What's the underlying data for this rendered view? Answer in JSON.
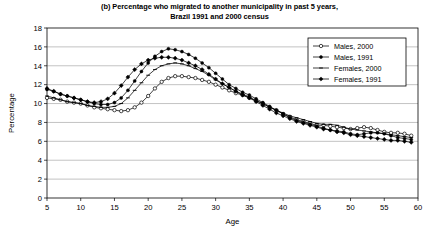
{
  "chart_data": {
    "type": "line",
    "title": "(b) Percentage who migrated to another municipality in past 5 years, Brazil 1991 and 2000 census",
    "title_line1": "(b) Percentage who migrated to another municipality in past 5 years,",
    "title_line2": "Brazil 1991 and 2000 census",
    "xlabel": "Age",
    "ylabel": "Percentage",
    "xlim": [
      5,
      60
    ],
    "ylim": [
      0,
      18
    ],
    "xticks": [
      5,
      10,
      15,
      20,
      25,
      30,
      35,
      40,
      45,
      50,
      55,
      60
    ],
    "yticks": [
      0,
      2,
      4,
      6,
      8,
      10,
      12,
      14,
      16,
      18
    ],
    "grid": "horizontal",
    "legend_position": "top-right",
    "x": [
      5,
      6,
      7,
      8,
      9,
      10,
      11,
      12,
      13,
      14,
      15,
      16,
      17,
      18,
      19,
      20,
      21,
      22,
      23,
      24,
      25,
      26,
      27,
      28,
      29,
      30,
      31,
      32,
      33,
      34,
      35,
      36,
      37,
      38,
      39,
      40,
      41,
      42,
      43,
      44,
      45,
      46,
      47,
      48,
      49,
      50,
      51,
      52,
      53,
      54,
      55,
      56,
      57,
      58,
      59
    ],
    "series": [
      {
        "name": "Males, 2000",
        "marker": "open-circle",
        "color": "#000000",
        "values": [
          10.6,
          10.5,
          10.4,
          10.2,
          10.1,
          10.0,
          9.8,
          9.6,
          9.5,
          9.4,
          9.3,
          9.2,
          9.3,
          9.6,
          10.1,
          10.8,
          11.6,
          12.3,
          12.7,
          12.9,
          12.9,
          12.8,
          12.7,
          12.5,
          12.3,
          12.0,
          11.7,
          11.4,
          11.1,
          10.9,
          10.6,
          10.3,
          10.0,
          9.6,
          9.3,
          8.9,
          8.6,
          8.3,
          8.1,
          7.9,
          7.7,
          7.7,
          7.6,
          7.5,
          7.4,
          7.3,
          7.4,
          7.5,
          7.4,
          7.2,
          7.0,
          6.9,
          6.9,
          6.8,
          6.6
        ]
      },
      {
        "name": "Males, 1991",
        "marker": "filled-circle",
        "color": "#000000",
        "values": [
          11.5,
          11.3,
          11.0,
          10.8,
          10.6,
          10.4,
          10.2,
          10.0,
          9.9,
          9.9,
          10.1,
          10.6,
          11.4,
          12.4,
          13.4,
          14.3,
          15.0,
          15.5,
          15.8,
          15.7,
          15.5,
          15.2,
          14.8,
          14.3,
          13.8,
          13.2,
          12.6,
          12.0,
          11.6,
          11.2,
          10.9,
          10.5,
          10.1,
          9.7,
          9.3,
          8.9,
          8.5,
          8.2,
          8.0,
          7.8,
          7.6,
          7.4,
          7.2,
          7.1,
          7.0,
          6.8,
          6.7,
          6.8,
          6.9,
          6.9,
          6.8,
          6.6,
          6.4,
          6.3,
          6.2
        ]
      },
      {
        "name": "Females, 2000",
        "marker": "dash",
        "color": "#000000",
        "values": [
          10.8,
          10.6,
          10.4,
          10.2,
          10.1,
          10.0,
          9.8,
          9.7,
          9.6,
          9.6,
          9.7,
          10.0,
          10.6,
          11.4,
          12.2,
          13.0,
          13.6,
          14.0,
          14.2,
          14.3,
          14.2,
          14.0,
          13.7,
          13.4,
          13.0,
          12.5,
          12.1,
          11.7,
          11.3,
          11.0,
          10.7,
          10.3,
          10.0,
          9.6,
          9.3,
          9.0,
          8.7,
          8.5,
          8.3,
          8.1,
          7.9,
          7.8,
          7.8,
          7.7,
          7.5,
          7.3,
          7.2,
          7.1,
          7.0,
          6.9,
          6.8,
          6.7,
          6.6,
          6.5,
          6.4
        ]
      },
      {
        "name": "Females, 1991",
        "marker": "filled-diamond",
        "color": "#000000",
        "values": [
          11.6,
          11.3,
          11.0,
          10.8,
          10.6,
          10.4,
          10.2,
          10.1,
          10.2,
          10.5,
          11.1,
          11.9,
          12.8,
          13.6,
          14.2,
          14.6,
          14.8,
          14.9,
          14.9,
          14.8,
          14.6,
          14.3,
          14.0,
          13.6,
          13.1,
          12.6,
          12.1,
          11.7,
          11.3,
          10.9,
          10.6,
          10.2,
          9.8,
          9.4,
          9.0,
          8.7,
          8.4,
          8.1,
          7.9,
          7.7,
          7.5,
          7.3,
          7.2,
          7.0,
          6.9,
          6.7,
          6.6,
          6.5,
          6.4,
          6.3,
          6.2,
          6.1,
          6.1,
          6.0,
          5.9
        ]
      }
    ]
  }
}
